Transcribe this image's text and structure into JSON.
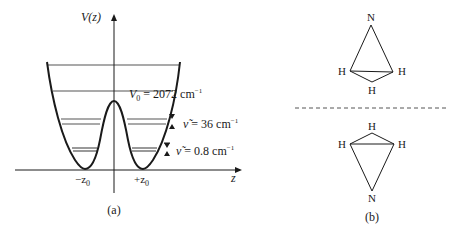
{
  "figure_a": {
    "caption": "(a)",
    "y_axis_label": "V(z)",
    "x_axis_label": "z",
    "tick_left": "−z",
    "tick_left_sub": "0",
    "tick_right": "+z",
    "tick_right_sub": "0",
    "barrier_label_prefix": "V",
    "barrier_label_sub": "0",
    "barrier_label_value": " = 2072 cm",
    "barrier_label_exp": "−1",
    "splitting_upper_prefix": "ν̃",
    "splitting_upper_value": " = 36 cm",
    "splitting_upper_exp": "−1",
    "splitting_lower_prefix": "ν̃",
    "splitting_lower_value": " = 0.8 cm",
    "splitting_lower_exp": "−1"
  },
  "figure_b": {
    "caption": "(b)",
    "top_molecule": {
      "apex": "N",
      "left": "H",
      "right": "H",
      "bottom": "H"
    },
    "bottom_molecule": {
      "top": "H",
      "left": "H",
      "right": "H",
      "apex": "N"
    }
  },
  "colors": {
    "ink": "#1a1a1a",
    "levels": "#555555"
  }
}
